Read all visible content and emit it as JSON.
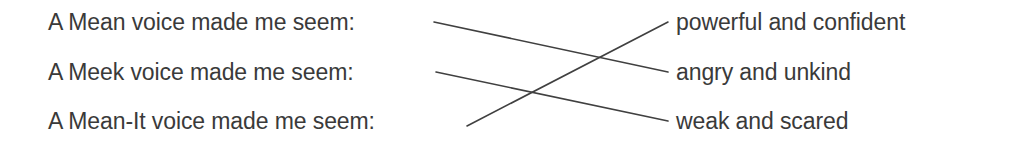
{
  "worksheet": {
    "title": "Voice tone matching exercise",
    "background_color": "#ffffff",
    "text_color": "#3a3a3a",
    "line_color": "#404040"
  },
  "prompts": [
    {
      "id": "mean",
      "text": "A Mean voice made me seem:"
    },
    {
      "id": "meek",
      "text": "A Meek voice made me seem:"
    },
    {
      "id": "mean-it",
      "text": "A Mean-It voice made me seem:"
    }
  ],
  "answers": [
    {
      "id": "powerful",
      "text": "powerful and confident"
    },
    {
      "id": "angry",
      "text": "angry and unkind"
    },
    {
      "id": "weak",
      "text": "weak and scared"
    }
  ],
  "connections": [
    {
      "from": "mean",
      "to": "angry",
      "x1": 434,
      "y1": 22,
      "x2": 668,
      "y2": 72
    },
    {
      "from": "meek",
      "to": "weak",
      "x1": 436,
      "y1": 72,
      "x2": 668,
      "y2": 121
    },
    {
      "from": "mean-it",
      "to": "powerful",
      "x1": 467,
      "y1": 126,
      "x2": 668,
      "y2": 22
    }
  ]
}
